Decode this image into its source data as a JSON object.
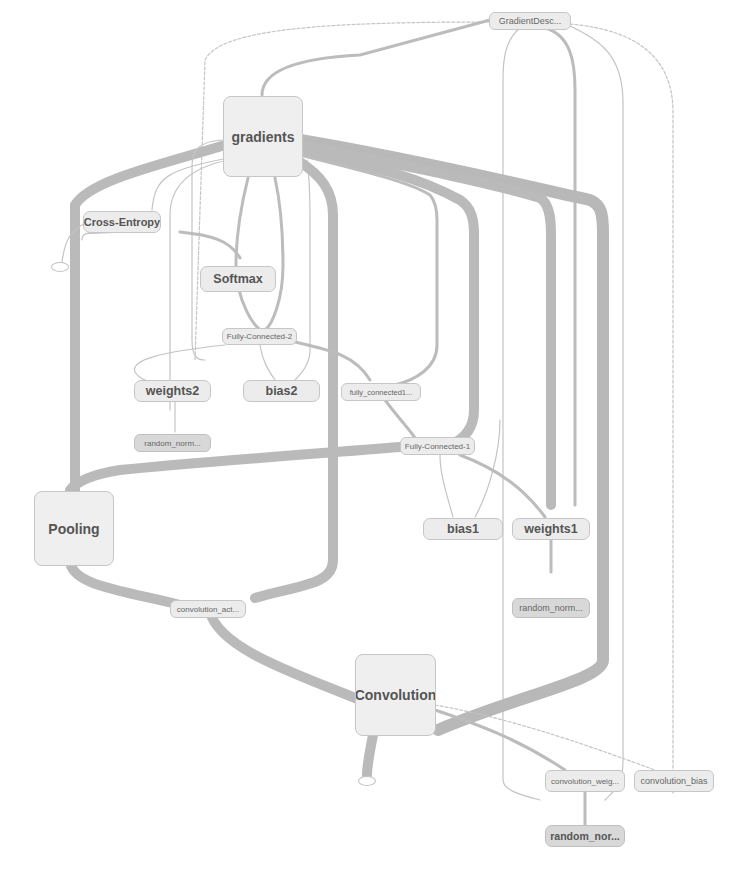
{
  "diagram": {
    "type": "tensorflow-computation-graph",
    "nodes": {
      "gradient_descent": "GradientDesc...",
      "gradients": "gradients",
      "cross_entropy": "Cross-Entropy",
      "softmax": "Softmax",
      "fully_connected_2": "Fully-Connected-2",
      "weights2": "weights2",
      "bias2": "bias2",
      "fully_connected1_var": "fully_connected1...",
      "random_norm_1": "random_norm...",
      "fully_connected_1": "Fully-Connected-1",
      "pooling": "Pooling",
      "bias1": "bias1",
      "weights1": "weights1",
      "convolution_act": "convolution_act...",
      "random_norm_2": "random_norm...",
      "convolution": "Convolution",
      "convolution_weights": "convolution_weig...",
      "convolution_bias": "convolution_bias",
      "random_norm_3": "random_nor..."
    },
    "edges": [
      {
        "from": "gradients",
        "to": "gradient_descent"
      },
      {
        "from": "gradients",
        "to": "cross_entropy"
      },
      {
        "from": "gradients",
        "to": "softmax"
      },
      {
        "from": "gradients",
        "to": "fully_connected_2"
      },
      {
        "from": "gradients",
        "to": "pooling"
      },
      {
        "from": "gradients",
        "to": "convolution_act"
      },
      {
        "from": "gradients",
        "to": "fully_connected1_var"
      },
      {
        "from": "gradients",
        "to": "fully_connected_1"
      },
      {
        "from": "gradients",
        "to": "weights1"
      },
      {
        "from": "gradients",
        "to": "convolution"
      },
      {
        "from": "gradient_descent",
        "to": "weights1"
      },
      {
        "from": "gradient_descent",
        "to": "convolution_weights"
      },
      {
        "from": "gradient_descent",
        "to": "convolution_bias"
      },
      {
        "from": "gradient_descent",
        "to": "weights2"
      },
      {
        "from": "cross_entropy",
        "to": "softmax"
      },
      {
        "from": "softmax",
        "to": "fully_connected_2"
      },
      {
        "from": "fully_connected_2",
        "to": "weights2"
      },
      {
        "from": "fully_connected_2",
        "to": "bias2"
      },
      {
        "from": "fully_connected_2",
        "to": "fully_connected1_var"
      },
      {
        "from": "weights2",
        "to": "random_norm_1"
      },
      {
        "from": "fully_connected1_var",
        "to": "fully_connected_1"
      },
      {
        "from": "fully_connected_1",
        "to": "pooling"
      },
      {
        "from": "fully_connected_1",
        "to": "bias1"
      },
      {
        "from": "fully_connected_1",
        "to": "weights1"
      },
      {
        "from": "weights1",
        "to": "random_norm_2"
      },
      {
        "from": "pooling",
        "to": "convolution_act"
      },
      {
        "from": "convolution_act",
        "to": "convolution"
      },
      {
        "from": "convolution",
        "to": "convolution_weights"
      },
      {
        "from": "convolution",
        "to": "convolution_bias"
      },
      {
        "from": "convolution_weights",
        "to": "random_norm_3"
      }
    ]
  }
}
